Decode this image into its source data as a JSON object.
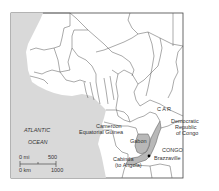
{
  "map": {
    "title": "Republic of the Congo location map",
    "colors": {
      "ocean": "#d9d9d9",
      "land": "#ffffff",
      "highlight": "#b8b8b8",
      "border": "#555555",
      "frame": "#444444"
    },
    "highlighted_country": "Congo",
    "labels": {
      "car": "C A R",
      "drc_1": "Democratic",
      "drc_2": "Republic",
      "drc_3": "of Congo",
      "cameroon": "Cameroon",
      "eq_guinea": "Equatorial Guinea",
      "gabon": "Gabon",
      "congo": "CONGO",
      "brazzaville": "Brazzaville",
      "cabinda_1": "Cabinda",
      "cabinda_2": "(to Angola)",
      "atlantic": "ATLANTIC",
      "ocean": "OCEAN"
    },
    "scale_bar": {
      "mi_label": "0 mi",
      "mi_value": "500",
      "km_label": "0 km",
      "km_value": "1000"
    },
    "capital": "Brazzaville"
  }
}
